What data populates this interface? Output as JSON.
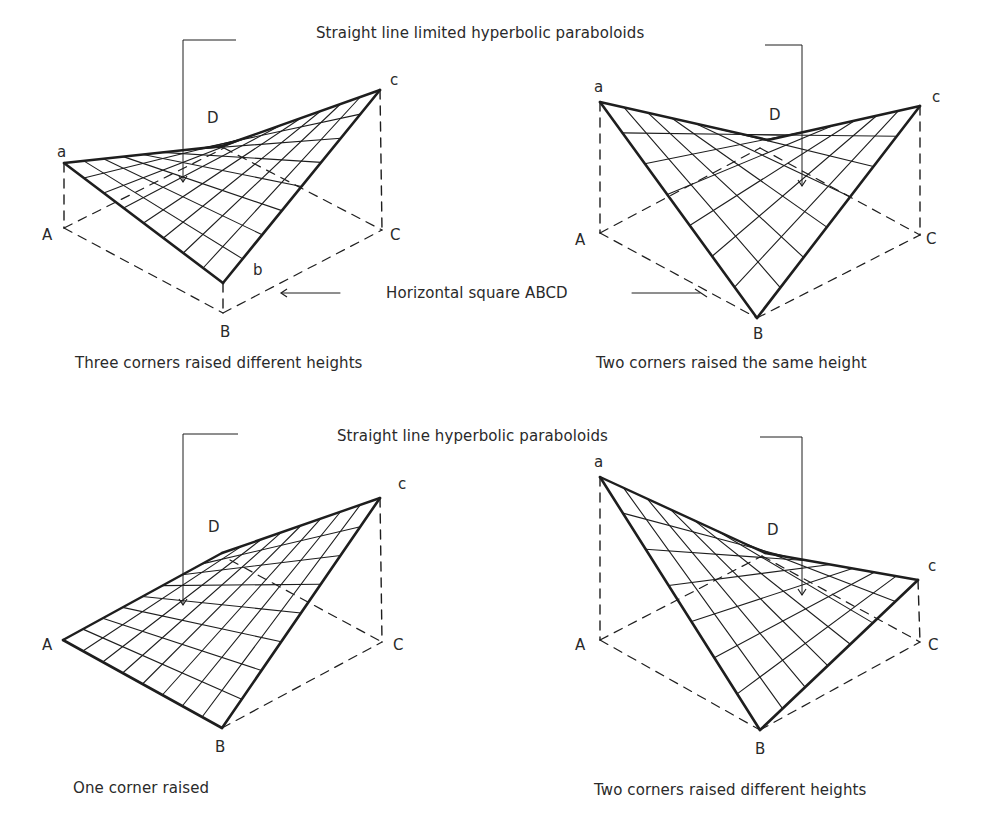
{
  "figure": {
    "headings": {
      "top": "Straight line limited hyperbolic paraboloids",
      "bottom": "Straight line hyperbolic paraboloids",
      "ground": "Horizontal square ABCD"
    },
    "panels": [
      {
        "id": "three-corners",
        "caption": "Three corners raised different heights",
        "labels": {
          "a": "a",
          "b": "b",
          "c": "c",
          "D": "D",
          "A": "A",
          "B": "B",
          "C": "C"
        }
      },
      {
        "id": "two-same",
        "caption": "Two corners raised the same height",
        "labels": {
          "a": "a",
          "c": "c",
          "D": "D",
          "A": "A",
          "B": "B",
          "C": "C"
        }
      },
      {
        "id": "one-corner",
        "caption": "One corner raised",
        "labels": {
          "c": "c",
          "D": "D",
          "A": "A",
          "B": "B",
          "C": "C"
        }
      },
      {
        "id": "two-different",
        "caption": "Two corners raised different heights",
        "labels": {
          "a": "a",
          "c": "c",
          "D": "D",
          "A": "A",
          "B": "B",
          "C": "C"
        }
      }
    ]
  }
}
